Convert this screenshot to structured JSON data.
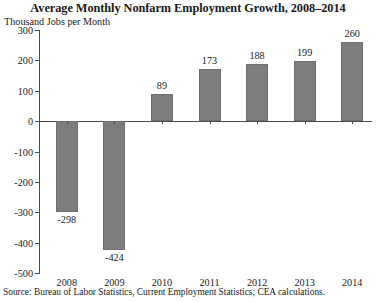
{
  "chart_data": {
    "type": "bar",
    "title": "Average Monthly Nonfarm Employment Growth, 2008–2014",
    "ylabel": "Thousand Jobs per Month",
    "xlabel": "",
    "categories": [
      "2008",
      "2009",
      "2010",
      "2011",
      "2012",
      "2013",
      "2014"
    ],
    "values": [
      -298,
      -424,
      89,
      173,
      188,
      199,
      260
    ],
    "value_labels": [
      "-298",
      "-424",
      "89",
      "173",
      "188",
      "199",
      "260"
    ],
    "ylim": [
      -500,
      300
    ],
    "yticks": [
      300,
      200,
      100,
      0,
      -100,
      -200,
      -300,
      -400,
      -500
    ],
    "ytick_labels": [
      "300",
      "200",
      "100",
      "0",
      "-100",
      "-200",
      "-300",
      "-400",
      "-500"
    ],
    "grid": false,
    "legend": null,
    "bar_color": "#7d7d7d",
    "axis_color": "#4a4a4a",
    "source": "Source: Bureau of Labor Statistics, Current Employment Statistics; CEA calculations."
  }
}
